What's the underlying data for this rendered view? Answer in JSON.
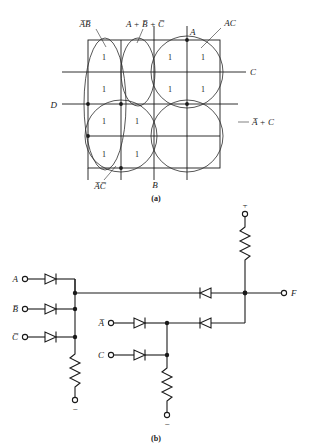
{
  "figure": {
    "panel_a": {
      "caption": "(a)",
      "type": "karnaugh-map",
      "size": "4x4",
      "axis_labels": {
        "left": "D",
        "right_upper": "C",
        "bottom": "B",
        "top": "A"
      },
      "group_labels": [
        {
          "id": "ab-bar",
          "text": "A̅B̅",
          "plain": "A'B'",
          "position": "top-left"
        },
        {
          "id": "a-bbar-cbar",
          "text": "A + B̅ + C̅",
          "plain": "A + B' + C'",
          "position": "top-center"
        },
        {
          "id": "ac",
          "text": "AC",
          "plain": "AC",
          "position": "top-right"
        },
        {
          "id": "abar-c",
          "text": "A̅ + C",
          "plain": "A' + C",
          "position": "right"
        },
        {
          "id": "abar-cbar",
          "text": "A̅C̅",
          "plain": "A'C'",
          "position": "bottom-left"
        }
      ],
      "cells": [
        [
          "1",
          "",
          "1",
          "1"
        ],
        [
          "1",
          "",
          "1",
          "1"
        ],
        [
          "1",
          "1",
          "",
          ""
        ],
        [
          "1",
          "1",
          "",
          ""
        ]
      ],
      "row_count": 4,
      "col_count": 4
    },
    "panel_b": {
      "caption": "(b)",
      "type": "diode-logic-circuit",
      "inputs_group1": [
        {
          "label": "A",
          "plain": "A"
        },
        {
          "label": "B̅",
          "plain": "B'"
        },
        {
          "label": "C̅",
          "plain": "C'"
        }
      ],
      "inputs_group2": [
        {
          "label": "A̅",
          "plain": "A'"
        },
        {
          "label": "C",
          "plain": "C"
        }
      ],
      "output": {
        "label": "F",
        "plain": "F"
      },
      "supply_positive": "+",
      "supply_negative_1": "−",
      "supply_negative_2": "−",
      "components": {
        "resistor_count": 3,
        "diode_count_forward": 5,
        "diode_count_reverse": 2
      }
    }
  },
  "colors": {
    "ink": "#1a1a1a",
    "grid": "#2b2b2b",
    "background": "#ffffff"
  }
}
